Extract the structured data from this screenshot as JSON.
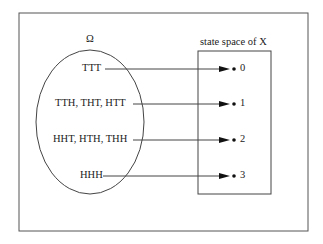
{
  "diagram": {
    "omega_label": "Ω",
    "state_space_label": "state space of X",
    "outcomes": [
      {
        "label": "TTT",
        "value": "0"
      },
      {
        "label": "TTH, THT, HTT",
        "value": "1"
      },
      {
        "label": "HHT, HTH, THH",
        "value": "2"
      },
      {
        "label": "HHH",
        "value": "3"
      }
    ],
    "colors": {
      "line": "#444444",
      "text": "#222222",
      "background": "#ffffff"
    }
  }
}
